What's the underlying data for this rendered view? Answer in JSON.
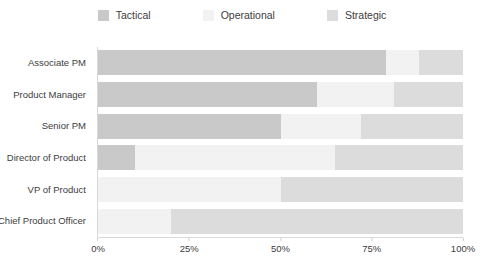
{
  "chart_data": {
    "type": "bar",
    "orientation": "horizontal",
    "stacked": true,
    "normalized": "100%",
    "title": "",
    "subtitle": "",
    "xlabel": "",
    "ylabel": "",
    "xlim": [
      0,
      100
    ],
    "grid": false,
    "legend_position": "top-center",
    "categories": [
      "Associate PM",
      "Product Manager",
      "Senior PM",
      "Director of Product",
      "VP of Product",
      "Chief Product Officer"
    ],
    "tick_labels": [
      "0%",
      "25%",
      "50%",
      "75%",
      "100%"
    ],
    "tick_values": [
      0,
      25,
      50,
      75,
      100
    ],
    "series": [
      {
        "name": "Tactical",
        "color": "#c9c9c9",
        "values": [
          79,
          60,
          50,
          10,
          0,
          0
        ]
      },
      {
        "name": "Operational",
        "color": "#f2f2f2",
        "values": [
          9,
          21,
          22,
          55,
          50,
          20
        ]
      },
      {
        "name": "Strategic",
        "color": "#dcdcdc",
        "values": [
          12,
          19,
          28,
          35,
          50,
          80
        ]
      }
    ]
  },
  "legend": {
    "items": [
      {
        "label": "Tactical",
        "swatch_name": "legend-swatch-tactical",
        "color": "#c9c9c9"
      },
      {
        "label": "Operational",
        "swatch_name": "legend-swatch-operational",
        "color": "#f2f2f2"
      },
      {
        "label": "Strategic",
        "swatch_name": "legend-swatch-strategic",
        "color": "#dcdcdc"
      }
    ]
  },
  "colors": {
    "background": "#ffffff",
    "axis": "#d8d8d8",
    "text": "#3d3d3d",
    "tactical": "#c9c9c9",
    "operational": "#f2f2f2",
    "strategic": "#dcdcdc"
  }
}
